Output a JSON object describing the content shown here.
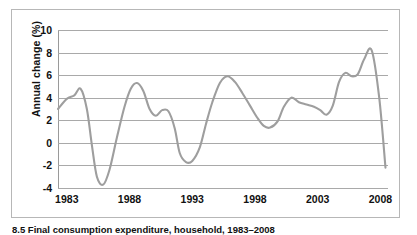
{
  "figure": {
    "caption": "8.5  Final consumption expenditure, household, 1983–2008",
    "border_color": "#b7b7b7",
    "background": "#ffffff"
  },
  "chart_data": {
    "type": "line",
    "title": "",
    "subtitle": "",
    "xlabel": "",
    "ylabel": "Annual change (%)",
    "line_color": "#9e9e9e",
    "grid_color": "#a9a9a9",
    "grid": true,
    "legend": "none",
    "xlim": [
      1982.3,
      2008.6
    ],
    "ylim": [
      -4,
      10
    ],
    "yticks": [
      10,
      8,
      6,
      4,
      2,
      0,
      -2,
      -4
    ],
    "ytick_labels": [
      "10",
      "8",
      "6",
      "4",
      "2",
      "0",
      "-2",
      "-4"
    ],
    "xticks": [
      1983,
      1988,
      1993,
      1998,
      2003,
      2008
    ],
    "xtick_labels": [
      "1983",
      "1988",
      "1993",
      "1998",
      "2003",
      "2008"
    ],
    "series": [
      {
        "name": "Annual change (%)",
        "x": [
          1982.3,
          1983.0,
          1983.6,
          1984.1,
          1984.6,
          1985.0,
          1985.4,
          1985.9,
          1986.4,
          1987.0,
          1987.6,
          1988.1,
          1988.6,
          1989.1,
          1989.6,
          1990.1,
          1990.6,
          1991.1,
          1991.6,
          1992.0,
          1992.5,
          1993.0,
          1993.6,
          1994.1,
          1994.6,
          1995.2,
          1995.8,
          1996.4,
          1997.0,
          1997.6,
          1998.2,
          1998.7,
          1999.2,
          1999.8,
          2000.3,
          2000.9,
          2001.5,
          2002.1,
          2002.7,
          2003.2,
          2003.7,
          2004.2,
          2004.7,
          2005.2,
          2005.7,
          2006.2,
          2006.7,
          2007.3,
          2007.9,
          2008.4
        ],
        "values": [
          3.0,
          3.9,
          4.2,
          4.8,
          3.0,
          -0.2,
          -3.0,
          -3.7,
          -2.4,
          0.5,
          3.2,
          4.8,
          5.3,
          4.6,
          3.0,
          2.4,
          2.9,
          2.8,
          1.3,
          -0.9,
          -1.7,
          -1.6,
          -0.4,
          1.7,
          3.6,
          5.3,
          5.9,
          5.4,
          4.4,
          3.3,
          2.2,
          1.5,
          1.35,
          1.9,
          3.2,
          4.0,
          3.6,
          3.4,
          3.2,
          2.9,
          2.5,
          3.3,
          5.4,
          6.2,
          5.9,
          6.1,
          7.4,
          8.2,
          4.0,
          -2.2
        ]
      }
    ]
  }
}
